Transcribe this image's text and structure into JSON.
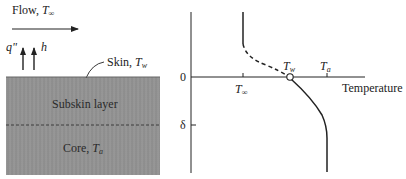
{
  "left_panel": {
    "flow_label": "Flow, ",
    "flow_symbol": "T",
    "flow_sub": "∞",
    "heat_flux_label": "q\"",
    "htc_label": "h",
    "skin_label": "Skin, ",
    "skin_symbol": "T",
    "skin_sub": "w",
    "subskin_label": "Subskin layer",
    "core_label": "Core, ",
    "core_symbol": "T",
    "core_sub": "a"
  },
  "right_panel": {
    "y_tick_zero": "0",
    "y_tick_delta": "δ",
    "x_axis_label": "Temperature",
    "x_tick_tinf_symbol": "T",
    "x_tick_tinf_sub": "∞",
    "x_tick_ta_symbol": "T",
    "x_tick_ta_sub": "a",
    "wall_point_symbol": "T",
    "wall_point_sub": "w"
  },
  "colors": {
    "tissue_fill": "#939393",
    "line": "#222222"
  }
}
